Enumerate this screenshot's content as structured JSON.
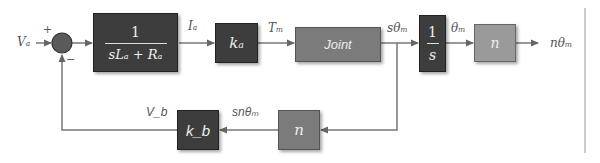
{
  "diagram": {
    "type": "block-diagram",
    "title": "",
    "input_signal": "V_a",
    "output_signal": "nθ_m",
    "summing_junction": {
      "plus_sign": "+",
      "minus_sign": "−"
    },
    "blocks": {
      "armature": {
        "numerator": "1",
        "denominator": "sLₐ + Rₐ"
      },
      "torque_constant": {
        "label": "kₐ"
      },
      "joint": {
        "label": "Joint"
      },
      "integrator": {
        "numerator": "1",
        "denominator": "s"
      },
      "gear_forward": {
        "label": "n"
      },
      "gear_feedback": {
        "label": "n"
      },
      "back_emf": {
        "label": "k_b"
      }
    },
    "signals": {
      "input": "Vₐ",
      "current": "Iₐ",
      "torque": "Tₘ",
      "velocity": "sθₘ",
      "angle": "θₘ",
      "output": "nθₘ",
      "back_emf": "V_b",
      "feedback_velocity": "snθₘ"
    },
    "colors": {
      "dark_block": "#3d3d3d",
      "mid_block": "#7b7b7b",
      "light_block": "#9a9a9a",
      "line": "#777777"
    }
  }
}
